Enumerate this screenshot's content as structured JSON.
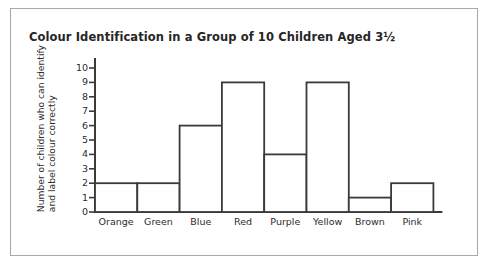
{
  "chart_data": {
    "type": "bar",
    "title": "Colour Identification in a Group of 10 Children Aged 3½",
    "xlabel": "",
    "ylabel": "Number of children who can identify and label colour correctly",
    "ylabel_lines": [
      "Number of children who can identify",
      "and label colour correctly"
    ],
    "categories": [
      "Orange",
      "Green",
      "Blue",
      "Red",
      "Purple",
      "Yellow",
      "Brown",
      "Pink"
    ],
    "values": [
      2,
      2,
      6,
      9,
      4,
      9,
      1,
      2
    ],
    "ylim": [
      0,
      10
    ],
    "ytick_labels": [
      "10",
      "9",
      "8",
      "7",
      "6",
      "5",
      "4",
      "3",
      "2",
      "1",
      "0"
    ],
    "ytick_values": [
      10,
      9,
      8,
      7,
      6,
      5,
      4,
      3,
      2,
      1,
      0
    ],
    "grid": false,
    "legend": null,
    "bar_fill": "#ffffff",
    "bar_outline": "#3a3a3a",
    "axis_color": "#3a3a3a",
    "text_color": "#2b2b2b",
    "frame_color": "#a8a8a8",
    "background": "#ffffff"
  }
}
